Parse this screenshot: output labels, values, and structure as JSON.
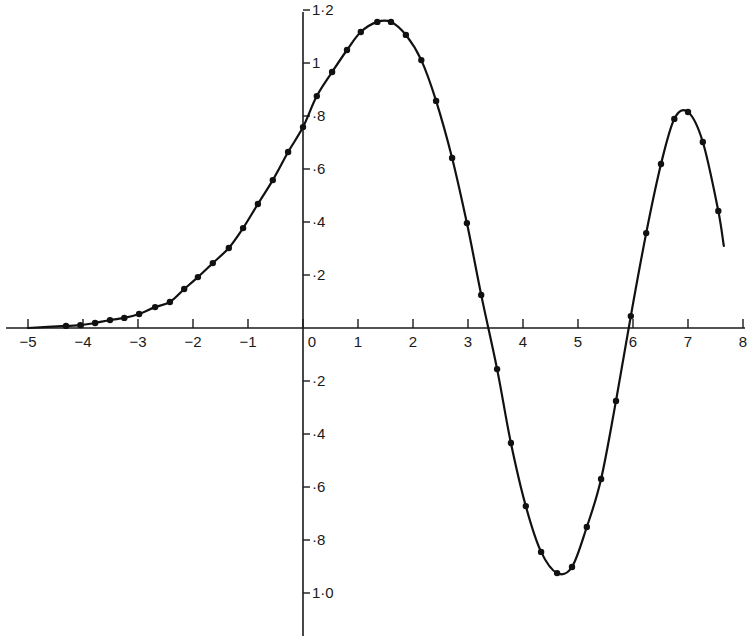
{
  "chart_data": {
    "type": "line",
    "title": "",
    "xlabel": "",
    "ylabel": "",
    "xlim": [
      -5,
      8
    ],
    "ylim": [
      -1.0,
      1.2
    ],
    "grid": false,
    "legend": null,
    "x_ticks": [
      {
        "value": -5,
        "label": "−5"
      },
      {
        "value": -4,
        "label": "−4"
      },
      {
        "value": -3,
        "label": "−3"
      },
      {
        "value": -2,
        "label": "−2"
      },
      {
        "value": -1,
        "label": "−1"
      },
      {
        "value": 0,
        "label": "0"
      },
      {
        "value": 1,
        "label": "1"
      },
      {
        "value": 2,
        "label": "2"
      },
      {
        "value": 3,
        "label": "3"
      },
      {
        "value": 4,
        "label": "4"
      },
      {
        "value": 5,
        "label": "5"
      },
      {
        "value": 6,
        "label": "6"
      },
      {
        "value": 7,
        "label": "7"
      },
      {
        "value": 8,
        "label": "8"
      }
    ],
    "y_ticks": [
      {
        "value": 1.2,
        "label": "1·2"
      },
      {
        "value": 1.0,
        "label": "1"
      },
      {
        "value": 0.8,
        "label": "·8"
      },
      {
        "value": 0.6,
        "label": "·6"
      },
      {
        "value": 0.4,
        "label": "·4"
      },
      {
        "value": 0.2,
        "label": "·2"
      },
      {
        "value": -0.2,
        "label": "·2"
      },
      {
        "value": -0.4,
        "label": "·4"
      },
      {
        "value": -0.6,
        "label": "·6"
      },
      {
        "value": -0.8,
        "label": "·8"
      },
      {
        "value": -1.0,
        "label": "1·0"
      }
    ],
    "series": [
      {
        "name": "curve",
        "style": "smooth line with dot markers",
        "x": [
          -4.31,
          -4.05,
          -3.78,
          -3.51,
          -3.25,
          -2.98,
          -2.69,
          -2.42,
          -2.16,
          -1.91,
          -1.64,
          -1.35,
          -1.09,
          -0.82,
          -0.55,
          -0.27,
          0.0,
          0.25,
          0.53,
          0.8,
          1.05,
          1.35,
          1.6,
          1.87,
          2.15,
          2.42,
          2.71,
          2.98,
          3.24,
          3.53,
          3.78,
          4.05,
          4.33,
          4.62,
          4.89,
          5.16,
          5.42,
          5.69,
          5.96,
          6.24,
          6.51,
          6.75,
          7.0,
          7.27,
          7.55
        ],
        "y": [
          0.008,
          0.011,
          0.019,
          0.03,
          0.038,
          0.053,
          0.079,
          0.098,
          0.147,
          0.192,
          0.245,
          0.302,
          0.377,
          0.468,
          0.558,
          0.664,
          0.758,
          0.875,
          0.966,
          1.049,
          1.117,
          1.155,
          1.155,
          1.106,
          1.011,
          0.857,
          0.642,
          0.396,
          0.125,
          -0.155,
          -0.434,
          -0.672,
          -0.845,
          -0.925,
          -0.902,
          -0.751,
          -0.57,
          -0.275,
          0.045,
          0.358,
          0.619,
          0.789,
          0.815,
          0.702,
          0.442
        ]
      }
    ],
    "curve_start": {
      "x": -5.0,
      "y": 0.0
    },
    "curve_end": {
      "x": 7.65,
      "y": 0.31
    }
  }
}
